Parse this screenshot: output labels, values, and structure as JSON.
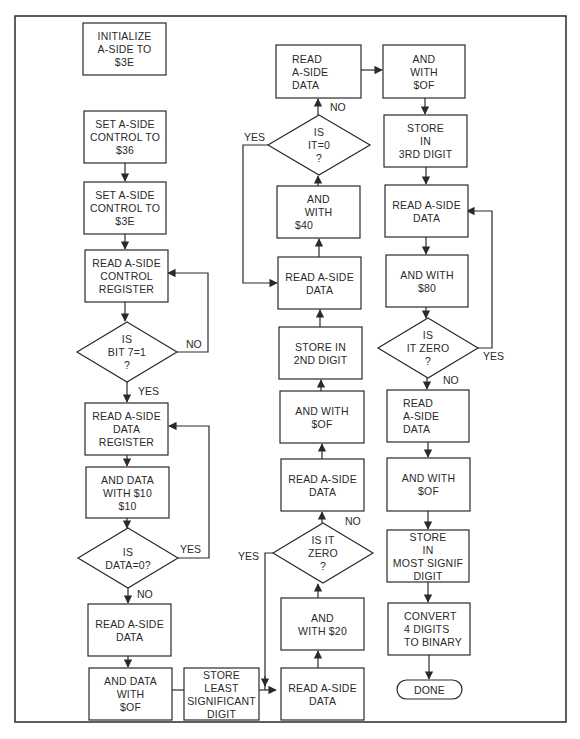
{
  "flowchart": {
    "nodes": {
      "init": {
        "type": "process",
        "lines": [
          "INITIALIZE",
          "A-SIDE TO",
          "$3E"
        ]
      },
      "set36": {
        "type": "process",
        "lines": [
          "SET A-SIDE",
          "CONTROL TO",
          "$36"
        ]
      },
      "set3e": {
        "type": "process",
        "lines": [
          "SET A-SIDE",
          "CONTROL TO",
          "$3E"
        ]
      },
      "readctrl": {
        "type": "process",
        "lines": [
          "READ A-SIDE",
          "CONTROL",
          "REGISTER"
        ]
      },
      "bit7": {
        "type": "decision",
        "lines": [
          "IS",
          "BIT 7=1",
          "?"
        ]
      },
      "readdatareg": {
        "type": "process",
        "lines": [
          "READ A-SIDE",
          "DATA",
          "REGISTER"
        ]
      },
      "and10": {
        "type": "process",
        "lines": [
          "AND DATA",
          "WITH $10",
          "$10"
        ]
      },
      "data0": {
        "type": "decision",
        "lines": [
          "IS",
          "DATA=0?"
        ]
      },
      "read1": {
        "type": "process",
        "lines": [
          "READ A-SIDE",
          "DATA"
        ]
      },
      "and0f1": {
        "type": "process",
        "lines": [
          "AND DATA",
          "WITH",
          "$OF"
        ]
      },
      "storelsd": {
        "type": "process",
        "lines": [
          "STORE",
          "LEAST",
          "SIGNIFICANT",
          "DIGIT"
        ]
      },
      "read2": {
        "type": "process",
        "lines": [
          "READ A-SIDE",
          "DATA"
        ]
      },
      "and20": {
        "type": "process",
        "lines": [
          "AND",
          "WITH $20"
        ]
      },
      "zero2": {
        "type": "decision",
        "lines": [
          "IS IT",
          "ZERO",
          "?"
        ]
      },
      "read3": {
        "type": "process",
        "lines": [
          "READ A-SIDE",
          "DATA"
        ]
      },
      "and0f2": {
        "type": "process",
        "lines": [
          "AND WITH",
          "$OF"
        ]
      },
      "store2nd": {
        "type": "process",
        "lines": [
          "STORE IN",
          "2ND DIGIT"
        ]
      },
      "read4": {
        "type": "process",
        "lines": [
          "READ A-SIDE",
          "DATA"
        ]
      },
      "and40": {
        "type": "process",
        "lines": [
          "AND",
          "WITH",
          "$40"
        ]
      },
      "it0": {
        "type": "decision",
        "lines": [
          "IS",
          "IT=0",
          "?"
        ]
      },
      "read5": {
        "type": "process",
        "lines": [
          "READ",
          "A-SIDE",
          "DATA"
        ]
      },
      "and0f3": {
        "type": "process",
        "lines": [
          "AND",
          "WITH",
          "$OF"
        ]
      },
      "store3rd": {
        "type": "process",
        "lines": [
          "STORE",
          "IN",
          "3RD DIGIT"
        ]
      },
      "read6": {
        "type": "process",
        "lines": [
          "READ A-SIDE",
          "DATA"
        ]
      },
      "and80": {
        "type": "process",
        "lines": [
          "AND WITH",
          "$80"
        ]
      },
      "zero3": {
        "type": "decision",
        "lines": [
          "IS",
          "IT ZERO",
          "?"
        ]
      },
      "read7": {
        "type": "process",
        "lines": [
          "READ",
          "A-SIDE",
          "DATA"
        ]
      },
      "and0f4": {
        "type": "process",
        "lines": [
          "AND WITH",
          "$OF"
        ]
      },
      "storemsd": {
        "type": "process",
        "lines": [
          "STORE",
          "IN",
          "MOST SIGNIF",
          "DIGIT"
        ]
      },
      "convert": {
        "type": "process",
        "lines": [
          "CONVERT",
          "4 DIGITS",
          "TO BINARY"
        ]
      },
      "done": {
        "type": "terminal",
        "lines": [
          "DONE"
        ]
      }
    },
    "labels": {
      "bit7_no": "NO",
      "bit7_yes": "YES",
      "data0_yes": "YES",
      "data0_no": "NO",
      "zero2_yes": "YES",
      "zero2_no": "NO",
      "it0_yes": "YES",
      "it0_no": "NO",
      "zero3_yes": "YES",
      "zero3_no": "NO"
    }
  }
}
